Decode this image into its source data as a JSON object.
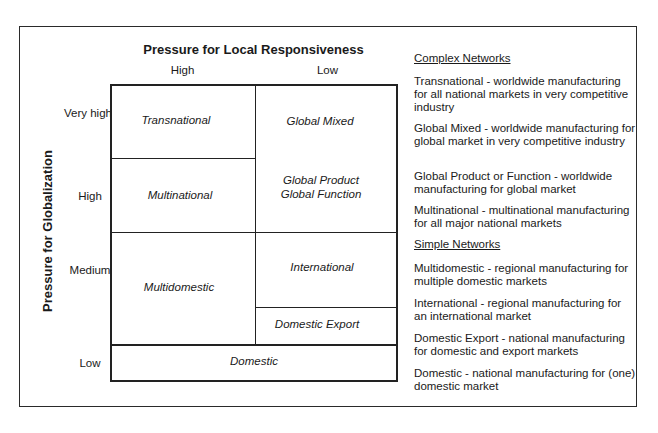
{
  "diagram": {
    "top_axis": {
      "title": "Pressure for Local Responsiveness",
      "columns": [
        "High",
        "Low"
      ]
    },
    "side_axis": {
      "title": "Pressure for Globalization",
      "rows": [
        "Very high",
        "High",
        "Medium",
        "Low"
      ]
    },
    "cells": {
      "transnational": "Transnational",
      "global_mixed": "Global Mixed",
      "multinational": "Multinational",
      "global_product_line1": "Global Product",
      "global_product_line2": "Global Function",
      "multidomestic": "Multidomestic",
      "international": "International",
      "domestic_export": "Domestic Export",
      "domestic": "Domestic"
    }
  },
  "legend": {
    "complex_header": "Complex Networks",
    "complex_items": [
      "Transnational  - worldwide manufacturing for all national markets in very competitive industry",
      "Global Mixed - worldwide manufacturing for global market in very competitive industry",
      "Global Product or Function - worldwide manufacturing for global market",
      "Multinational - multinational manufacturing for all major national markets"
    ],
    "simple_header": "Simple Networks",
    "simple_items": [
      "Multidomestic - regional manufacturing for multiple domestic markets",
      "International - regional manufacturing for an international market",
      "Domestic Export - national manufacturing for domestic and export markets",
      "Domestic - national manufacturing for (one) domestic market"
    ]
  }
}
